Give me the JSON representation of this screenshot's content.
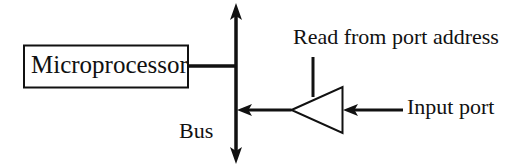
{
  "diagram": {
    "colors": {
      "background": "#ffffff",
      "stroke": "#111111",
      "text": "#111111"
    },
    "blocks": {
      "microprocessor": {
        "label": "Microprocessor",
        "shape": "rectangle"
      },
      "buffer": {
        "label": "",
        "shape": "triangle",
        "orientation": "points-left"
      }
    },
    "labels": {
      "bus": "Bus",
      "read_from_port_address": "Read from port address",
      "input_port": "Input port"
    },
    "icons": {
      "bus_arrow_up": "arrow-up-icon",
      "bus_arrow_down": "arrow-down-icon",
      "buffer_output_arrow": "arrow-left-icon",
      "input_port_arrow": "arrow-left-icon"
    }
  }
}
